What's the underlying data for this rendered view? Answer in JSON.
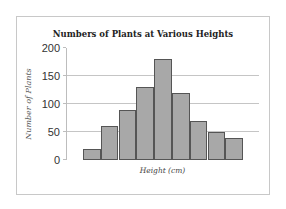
{
  "chart_data": {
    "type": "bar",
    "title": "Numbers of Plants at Various Heights",
    "xlabel": "Height (cm)",
    "ylabel": "Number of Plants",
    "categories": [
      "1",
      "2",
      "3",
      "4",
      "5",
      "6",
      "7",
      "8",
      "9"
    ],
    "values": [
      20,
      60,
      90,
      130,
      180,
      120,
      70,
      50,
      40
    ],
    "ylim": [
      0,
      200
    ],
    "yticks": [
      0,
      50,
      100,
      150,
      200
    ],
    "grid": true,
    "legend": "none",
    "bar_color": "#a8a8a8",
    "bar_edge_color": "#555555"
  },
  "labels": {
    "title": "Numbers of Plants at Various Heights",
    "xlabel": "Height (cm)",
    "ylabel": "Number of Plants",
    "yticks": [
      "200",
      "150",
      "100",
      "50",
      "0"
    ]
  }
}
